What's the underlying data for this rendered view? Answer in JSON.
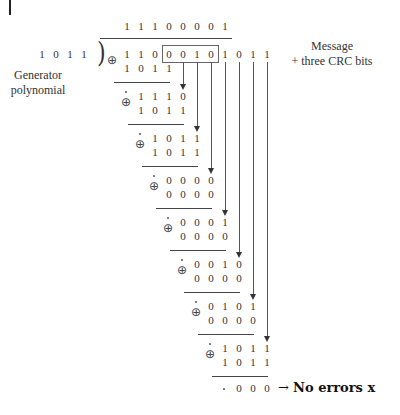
{
  "quotient": [
    "1",
    "1",
    "1",
    "0",
    "0",
    "0",
    "0",
    "1"
  ],
  "divisor": {
    "bits": [
      "1",
      "0",
      "1",
      "1"
    ],
    "label_line1": "Generator",
    "label_line2": "polynomial"
  },
  "dividend": {
    "bits": [
      "1",
      "1",
      "0",
      "0",
      "0",
      "1",
      "0",
      "1",
      "0",
      "1",
      "1"
    ],
    "label_line1": "Message",
    "label_line2": "+ three CRC bits",
    "boxed_range": [
      3,
      6
    ]
  },
  "steps": [
    {
      "top": [
        "1",
        "1",
        "0",
        "0"
      ],
      "bottom": [
        "1",
        "0",
        "1",
        "1"
      ]
    },
    {
      "top": [
        "1",
        "1",
        "1",
        "0"
      ],
      "bottom": [
        "1",
        "0",
        "1",
        "1"
      ]
    },
    {
      "top": [
        "1",
        "0",
        "1",
        "1"
      ],
      "bottom": [
        "1",
        "0",
        "1",
        "1"
      ]
    },
    {
      "top": [
        "0",
        "0",
        "0",
        "0"
      ],
      "bottom": [
        "0",
        "0",
        "0",
        "0"
      ]
    },
    {
      "top": [
        "0",
        "0",
        "0",
        "1"
      ],
      "bottom": [
        "0",
        "0",
        "0",
        "0"
      ]
    },
    {
      "top": [
        "0",
        "0",
        "1",
        "0"
      ],
      "bottom": [
        "0",
        "0",
        "0",
        "0"
      ]
    },
    {
      "top": [
        "0",
        "1",
        "0",
        "1"
      ],
      "bottom": [
        "0",
        "0",
        "0",
        "0"
      ]
    },
    {
      "top": [
        "1",
        "0",
        "1",
        "1"
      ],
      "bottom": [
        "1",
        "0",
        "1",
        "1"
      ]
    }
  ],
  "remainder": [
    "0",
    "0",
    "0"
  ],
  "result": {
    "arrow": "→",
    "text": "No errors x"
  },
  "symbols": {
    "xor": "⊕",
    "bracket": ")"
  }
}
